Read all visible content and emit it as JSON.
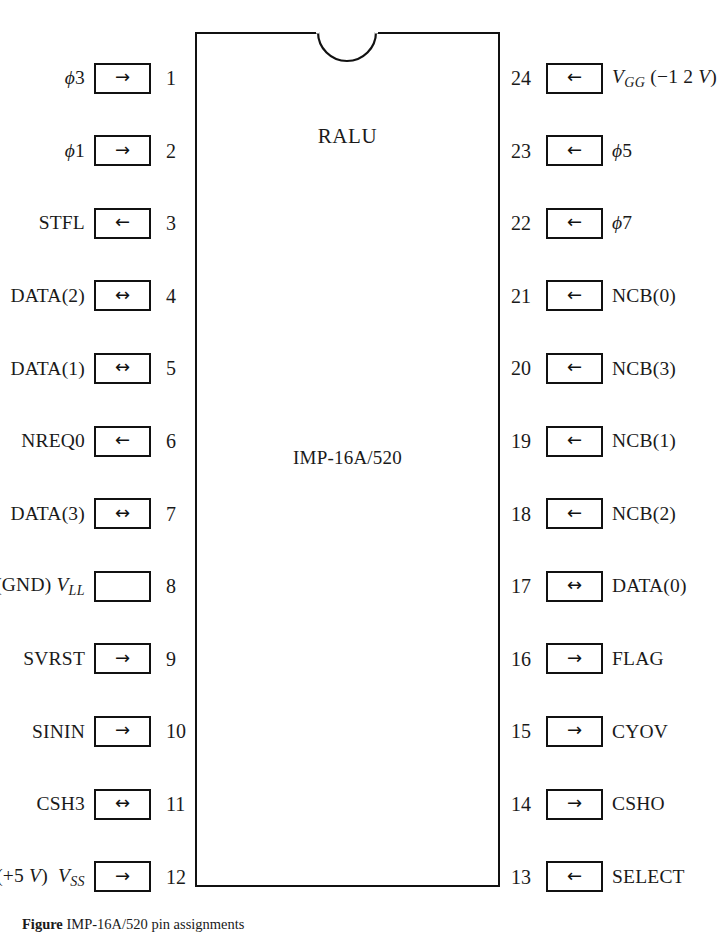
{
  "figure": {
    "chip": {
      "title": "RALU",
      "part_number": "IMP-16A/520",
      "notch_icon": "semicircle-notch"
    },
    "left_pins": [
      {
        "number": "1",
        "signal_html": "<span class=\"it\">ϕ</span>3",
        "direction": "in",
        "arrow": "→"
      },
      {
        "number": "2",
        "signal_html": "<span class=\"it\">ϕ</span>1",
        "direction": "in",
        "arrow": "→"
      },
      {
        "number": "3",
        "signal_html": "STFL",
        "direction": "out",
        "arrow": "←"
      },
      {
        "number": "4",
        "signal_html": "DATA(2)",
        "direction": "bidirectional",
        "arrow": "↔"
      },
      {
        "number": "5",
        "signal_html": "DATA(1)",
        "direction": "bidirectional",
        "arrow": "↔"
      },
      {
        "number": "6",
        "signal_html": "NREQ0",
        "direction": "out",
        "arrow": "←"
      },
      {
        "number": "7",
        "signal_html": "DATA(3)",
        "direction": "bidirectional",
        "arrow": "↔"
      },
      {
        "number": "8",
        "signal_html": "(GND) <span class=\"it\">V</span><span class=\"sub\">LL</span>",
        "direction": "power",
        "arrow": ""
      },
      {
        "number": "9",
        "signal_html": "SVRST",
        "direction": "in",
        "arrow": "→"
      },
      {
        "number": "10",
        "signal_html": "SININ",
        "direction": "in",
        "arrow": "→"
      },
      {
        "number": "11",
        "signal_html": "CSH3",
        "direction": "bidirectional",
        "arrow": "↔"
      },
      {
        "number": "12",
        "signal_html": "(+5 <span class=\"it\">V</span>) &nbsp;<span class=\"it\">V</span><span class=\"sub\">SS</span>",
        "direction": "in",
        "arrow": "→"
      }
    ],
    "right_pins": [
      {
        "number": "24",
        "signal_html": "<span class=\"it\">V</span><span class=\"sub\">GG</span> <span class=\"paren-grp\">(−1 2 <span class=\"it\">V</span>)</span>",
        "direction": "power",
        "arrow": "←"
      },
      {
        "number": "23",
        "signal_html": "<span class=\"it\">ϕ</span>5",
        "direction": "in",
        "arrow": "←"
      },
      {
        "number": "22",
        "signal_html": "<span class=\"it\">ϕ</span>7",
        "direction": "in",
        "arrow": "←"
      },
      {
        "number": "21",
        "signal_html": "NCB(0)",
        "direction": "in",
        "arrow": "←"
      },
      {
        "number": "20",
        "signal_html": "NCB(3)",
        "direction": "in",
        "arrow": "←"
      },
      {
        "number": "19",
        "signal_html": "NCB(1)",
        "direction": "in",
        "arrow": "←"
      },
      {
        "number": "18",
        "signal_html": "NCB(2)",
        "direction": "in",
        "arrow": "←"
      },
      {
        "number": "17",
        "signal_html": "DATA(0)",
        "direction": "bidirectional",
        "arrow": "↔"
      },
      {
        "number": "16",
        "signal_html": "FLAG",
        "direction": "out",
        "arrow": "→"
      },
      {
        "number": "15",
        "signal_html": "CYOV",
        "direction": "out",
        "arrow": "→"
      },
      {
        "number": "14",
        "signal_html": "CSHO",
        "direction": "out",
        "arrow": "→"
      },
      {
        "number": "13",
        "signal_html": "SELECT",
        "direction": "in",
        "arrow": "←"
      }
    ],
    "caption_html": "<span class=\"cap-bold\">Figure</span> IMP-16A/520 pin assignments"
  }
}
